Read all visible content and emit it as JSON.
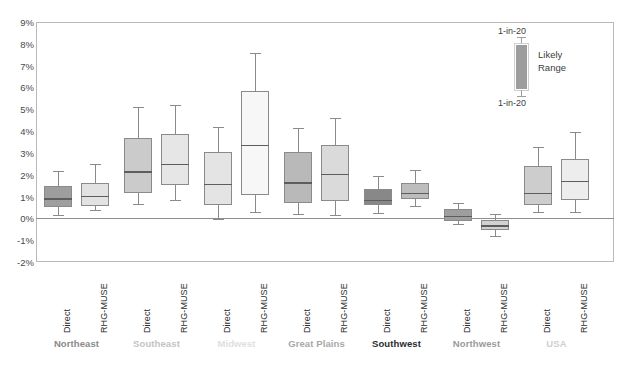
{
  "chart_data": {
    "type": "box",
    "title": "",
    "xlabel": "",
    "ylabel": "",
    "ylim": [
      -2,
      9
    ],
    "ytick_labels": [
      "9%",
      "8%",
      "7%",
      "6%",
      "5%",
      "4%",
      "3%",
      "2%",
      "1%",
      "0%",
      "-1%",
      "-2%"
    ],
    "ytick_values": [
      9,
      8,
      7,
      6,
      5,
      4,
      3,
      2,
      1,
      0,
      -1,
      -2
    ],
    "grid": false,
    "zero_line": true,
    "legend": {
      "position": "top-right",
      "upper_label": "1-in-20",
      "lower_label": "1-in-20",
      "range_label_line1": "Likely",
      "range_label_line2": "Range",
      "swatch_color": "#9d9d9d"
    },
    "series_names": [
      "Direct",
      "RHG-MUSE"
    ],
    "groups": [
      {
        "name": "Northeast",
        "label_color": "#8a8a8a",
        "boxes": [
          {
            "series": "Direct",
            "fill": "#9e9e9e",
            "whisker_low": 0.15,
            "q1": 0.5,
            "median": 0.88,
            "q3": 1.5,
            "whisker_high": 2.15
          },
          {
            "series": "RHG-MUSE",
            "fill": "#e2e2e2",
            "whisker_low": 0.38,
            "q1": 0.58,
            "median": 1.0,
            "q3": 1.62,
            "whisker_high": 2.48
          }
        ]
      },
      {
        "name": "Southeast",
        "label_color": "#c3c3c3",
        "boxes": [
          {
            "series": "Direct",
            "fill": "#cbcbcb",
            "whisker_low": 0.65,
            "q1": 1.18,
            "median": 2.12,
            "q3": 3.68,
            "whisker_high": 5.1
          },
          {
            "series": "RHG-MUSE",
            "fill": "#e6e6e6",
            "whisker_low": 0.82,
            "q1": 1.55,
            "median": 2.48,
            "q3": 3.85,
            "whisker_high": 5.18
          }
        ]
      },
      {
        "name": "Midwest",
        "label_color": "#e0e0e0",
        "boxes": [
          {
            "series": "Direct",
            "fill": "#e4e4e4",
            "whisker_low": -0.05,
            "q1": 0.62,
            "median": 1.55,
            "q3": 3.05,
            "whisker_high": 4.18
          },
          {
            "series": "RHG-MUSE",
            "fill": "#f7f7f7",
            "whisker_low": 0.28,
            "q1": 1.05,
            "median": 3.35,
            "q3": 5.82,
            "whisker_high": 7.6
          }
        ]
      },
      {
        "name": "Great Plains",
        "label_color": "#a8a8a8",
        "boxes": [
          {
            "series": "Direct",
            "fill": "#b9b9b9",
            "whisker_low": 0.18,
            "q1": 0.72,
            "median": 1.62,
            "q3": 3.05,
            "whisker_high": 4.12
          },
          {
            "series": "RHG-MUSE",
            "fill": "#dadada",
            "whisker_low": 0.15,
            "q1": 0.78,
            "median": 2.0,
            "q3": 3.35,
            "whisker_high": 4.6
          }
        ]
      },
      {
        "name": "Southwest",
        "label_color": "#2b2b2b",
        "boxes": [
          {
            "series": "Direct",
            "fill": "#888888",
            "whisker_low": 0.25,
            "q1": 0.6,
            "median": 0.82,
            "q3": 1.35,
            "whisker_high": 1.95
          },
          {
            "series": "RHG-MUSE",
            "fill": "#bdbdbd",
            "whisker_low": 0.55,
            "q1": 0.9,
            "median": 1.15,
            "q3": 1.62,
            "whisker_high": 2.22
          }
        ]
      },
      {
        "name": "Northwest",
        "label_color": "#9a9a9a",
        "boxes": [
          {
            "series": "Direct",
            "fill": "#9e9e9e",
            "whisker_low": -0.28,
            "q1": -0.12,
            "median": 0.08,
            "q3": 0.42,
            "whisker_high": 0.72
          },
          {
            "series": "RHG-MUSE",
            "fill": "#d2d2d2",
            "whisker_low": -0.82,
            "q1": -0.55,
            "median": -0.35,
            "q3": -0.08,
            "whisker_high": 0.18
          }
        ]
      },
      {
        "name": "USA",
        "label_color": "#d0d0d0",
        "boxes": [
          {
            "series": "Direct",
            "fill": "#cdcdcd",
            "whisker_low": 0.28,
            "q1": 0.62,
            "median": 1.15,
            "q3": 2.38,
            "whisker_high": 3.25
          },
          {
            "series": "RHG-MUSE",
            "fill": "#ededed",
            "whisker_low": 0.3,
            "q1": 0.82,
            "median": 1.7,
            "q3": 2.72,
            "whisker_high": 3.95
          }
        ]
      }
    ]
  }
}
